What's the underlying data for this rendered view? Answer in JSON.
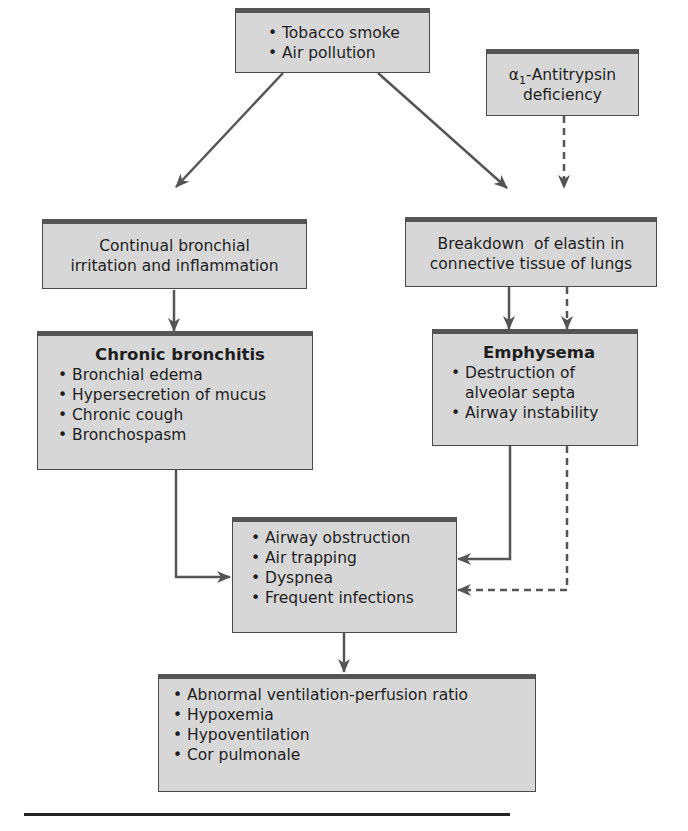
{
  "diagram": {
    "topic": "Pathogenesis of chronic obstructive pulmonary disease",
    "colors": {
      "box_fill": "#d7d7d7",
      "box_border": "#4a4a4a",
      "box_top_band": "#555555",
      "arrow": "#555555",
      "rule": "#222222",
      "text": "#1e1e1e"
    },
    "nodes": {
      "causes": {
        "items": [
          "Tobacco smoke",
          "Air pollution"
        ]
      },
      "aat_deficiency": {
        "alpha": "α",
        "subscript": "1",
        "label_rest": "-Antitrypsin",
        "label_line2": "deficiency"
      },
      "bronchial_irritation": {
        "line1": "Continual bronchial",
        "line2": "irritation and inflammation"
      },
      "elastin_breakdown": {
        "line1": "Breakdown  of elastin in",
        "line2": "connective tissue of lungs"
      },
      "chronic_bronchitis": {
        "title": "Chronic bronchitis",
        "items": [
          "Bronchial edema",
          "Hypersecretion of mucus",
          "Chronic cough",
          "Bronchospasm"
        ]
      },
      "emphysema": {
        "title": "Emphysema",
        "items": [
          "Destruction of alveolar septa",
          "Airway instability"
        ]
      },
      "obstruction": {
        "items": [
          "Airway obstruction",
          "Air trapping",
          "Dyspnea",
          "Frequent infections"
        ]
      },
      "outcomes": {
        "items": [
          "Abnormal ventilation-perfusion ratio",
          "Hypoxemia",
          "Hypoventilation",
          "Cor pulmonale"
        ]
      }
    },
    "edges": [
      {
        "from": "causes",
        "to": "bronchial_irritation",
        "style": "solid"
      },
      {
        "from": "causes",
        "to": "elastin_breakdown",
        "style": "solid"
      },
      {
        "from": "aat_deficiency",
        "to": "elastin_breakdown",
        "style": "dashed"
      },
      {
        "from": "bronchial_irritation",
        "to": "chronic_bronchitis",
        "style": "solid"
      },
      {
        "from": "elastin_breakdown",
        "to": "emphysema",
        "style": "solid"
      },
      {
        "from": "elastin_breakdown",
        "to": "emphysema",
        "style": "dashed"
      },
      {
        "from": "chronic_bronchitis",
        "to": "obstruction",
        "style": "solid"
      },
      {
        "from": "emphysema",
        "to": "obstruction",
        "style": "solid"
      },
      {
        "from": "emphysema",
        "to": "obstruction",
        "style": "dashed"
      },
      {
        "from": "obstruction",
        "to": "outcomes",
        "style": "solid"
      }
    ]
  }
}
